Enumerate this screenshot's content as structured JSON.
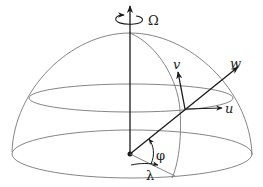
{
  "diagram": {
    "labels": {
      "omega": "Ω",
      "u": "u",
      "v": "v",
      "w": "w",
      "phi": "φ",
      "lambda": "λ"
    },
    "colors": {
      "outline": "#777777",
      "vector": "#1a1a1a",
      "background": "#ffffff"
    }
  }
}
